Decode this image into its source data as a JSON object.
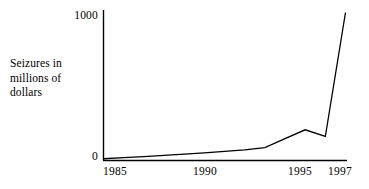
{
  "chart_data": {
    "type": "line",
    "title": "",
    "subtitle": "",
    "xlabel": "",
    "ylabel": "Seizures in millions of dollars",
    "ylabel_lines": [
      "Seizures in",
      "millions of",
      "dollars"
    ],
    "x": [
      1985,
      1986,
      1987,
      1988,
      1989,
      1990,
      1991,
      1992,
      1993,
      1994,
      1995,
      1996,
      1997
    ],
    "values": [
      5,
      12,
      20,
      28,
      36,
      45,
      55,
      65,
      80,
      140,
      200,
      155,
      990
    ],
    "series": [
      {
        "name": "Seizures",
        "values": [
          5,
          12,
          20,
          28,
          36,
          45,
          55,
          65,
          80,
          140,
          200,
          155,
          990
        ],
        "color": "#000000"
      }
    ],
    "xlim": [
      1985,
      1997
    ],
    "ylim": [
      0,
      1000
    ],
    "yticks": [
      0,
      1000
    ],
    "ytick_labels": [
      "0",
      "1000"
    ],
    "xticks": [
      1985,
      1990,
      1995,
      1997
    ],
    "xtick_labels": [
      "1985",
      "1990",
      "1995",
      "1997"
    ],
    "grid": false,
    "legend": false,
    "legend_position": "none",
    "line_color": "#000000",
    "axis_color": "#000000",
    "background_color": "#ffffff",
    "markers": false,
    "annotations": []
  },
  "axis": {
    "y_title_line1": "Seizures in",
    "y_title_line2": "millions of",
    "y_title_line3": "dollars",
    "y_top_label": "1000",
    "y_zero_label": "0",
    "x_label_1": "1985",
    "x_label_2": "1990",
    "x_label_3": "1995",
    "x_label_4": "1997"
  }
}
